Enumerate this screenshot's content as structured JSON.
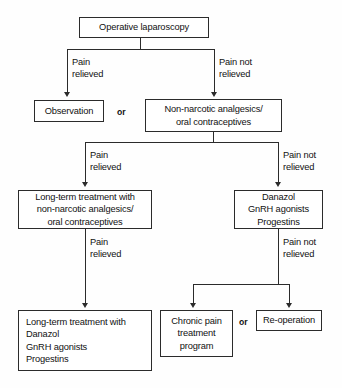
{
  "diagram": {
    "type": "flowchart",
    "nodes": {
      "operative_laparoscopy": "Operative laparoscopy",
      "observation": "Observation",
      "non_narcotic": "Non-narcotic analgesics/\noral contraceptives",
      "long_term_non_narcotic": "Long-term treatment with\nnon-narcotic analgesics/\noral contraceptives",
      "danazol_group": "Danazol\nGnRH agonists\nProgestins",
      "long_term_danazol": "Long-term treatment with\nDanazol\nGnRH agonists\nProgestins",
      "chronic_pain": "Chronic pain\ntreatment\nprogram",
      "reoperation": "Re-operation"
    },
    "edge_labels": {
      "pain_relieved_1": "Pain\nrelieved",
      "pain_not_relieved_1": "Pain not\nrelieved",
      "pain_relieved_2": "Pain\nrelieved",
      "pain_not_relieved_2": "Pain not\nrelieved",
      "pain_relieved_3": "Pain\nrelieved",
      "pain_not_relieved_3": "Pain not\nrelieved"
    },
    "connectors": {
      "or_top": "or",
      "or_bottom": "or"
    },
    "colors": {
      "stroke": "#2b2b2b",
      "background": "#fefefe",
      "text": "#111111"
    }
  }
}
